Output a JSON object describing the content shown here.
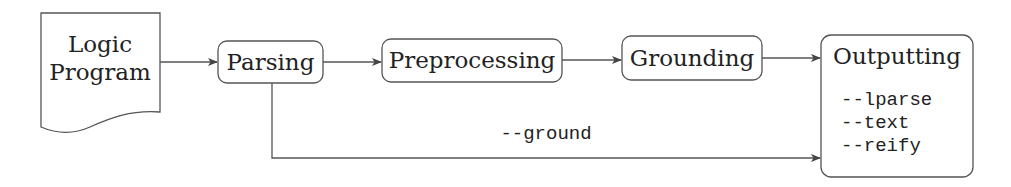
{
  "diagram": {
    "type": "flowchart",
    "nodes": {
      "input": {
        "lines": [
          "Logic",
          "Program"
        ],
        "shape": "document"
      },
      "parsing": {
        "label": "Parsing",
        "shape": "rounded-rect"
      },
      "preprocessing": {
        "label": "Preprocessing",
        "shape": "rounded-rect"
      },
      "grounding": {
        "label": "Grounding",
        "shape": "rounded-rect"
      },
      "outputting": {
        "label": "Outputting",
        "shape": "rounded-rect",
        "options": [
          "--lparse",
          "--text",
          "--reify"
        ]
      }
    },
    "edges": [
      {
        "from": "input",
        "to": "parsing",
        "label": ""
      },
      {
        "from": "parsing",
        "to": "preprocessing",
        "label": ""
      },
      {
        "from": "preprocessing",
        "to": "grounding",
        "label": ""
      },
      {
        "from": "grounding",
        "to": "outputting",
        "label": ""
      },
      {
        "from": "parsing",
        "to": "outputting",
        "label": "--ground"
      }
    ],
    "stroke_color": "#555555",
    "text_color": "#222222"
  }
}
